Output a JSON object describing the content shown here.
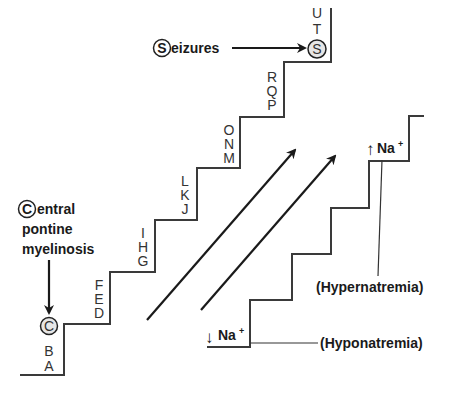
{
  "diagram": {
    "left_staircase": {
      "letters": [
        "A",
        "B",
        "C",
        "D",
        "E",
        "F",
        "G",
        "H",
        "I",
        "J",
        "K",
        "L",
        "M",
        "N",
        "O",
        "P",
        "Q",
        "R",
        "S",
        "T",
        "U"
      ],
      "circled_letters": [
        "C",
        "S"
      ]
    },
    "labels": {
      "seizures": {
        "initial": "S",
        "rest": "eizures"
      },
      "cpm": {
        "initial": "C",
        "line1_rest": "entral",
        "line2": "pontine",
        "line3": "myelinosis"
      },
      "high_na": {
        "arrow": "↑",
        "text": "Na",
        "sup": "+"
      },
      "low_na": {
        "arrow": "↓",
        "text": "Na",
        "sup": "+"
      },
      "hypernatremia": "(Hypernatremia)",
      "hyponatremia": "(Hyponatremia)"
    },
    "colors": {
      "line": "#3a3a3a",
      "text": "#1a1a1a",
      "circle_fill": "#e6e6e6",
      "background": "#ffffff"
    }
  }
}
